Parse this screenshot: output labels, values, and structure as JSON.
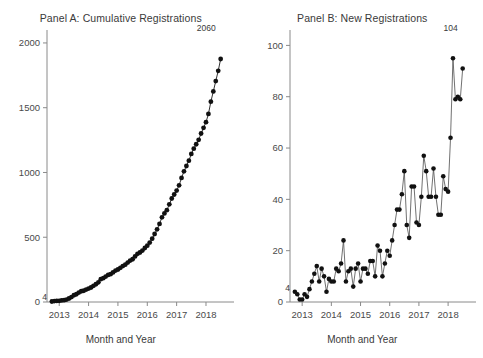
{
  "figure": {
    "width": 483,
    "height": 358,
    "background": "#ffffff",
    "ink_color": "#111111",
    "axis_color": "#8a8a8a"
  },
  "panels": [
    {
      "key": "panel_a",
      "title": "Panel A: Cumulative Registrations",
      "xlabel": "Month and Year",
      "first_point_label": "4",
      "last_point_label": "2060"
    },
    {
      "key": "panel_b",
      "title": "Panel B: New Registrations",
      "xlabel": "Month and Year",
      "first_point_label": "4",
      "last_point_label": "104"
    }
  ],
  "chart_data": [
    {
      "type": "line",
      "panel": "A",
      "title": "Panel A: Cumulative Registrations",
      "xlabel": "Month and Year",
      "ylabel": "",
      "x": [
        "2012-10",
        "2012-11",
        "2012-12",
        "2013-01",
        "2013-02",
        "2013-03",
        "2013-04",
        "2013-05",
        "2013-06",
        "2013-07",
        "2013-08",
        "2013-09",
        "2013-10",
        "2013-11",
        "2013-12",
        "2014-01",
        "2014-02",
        "2014-03",
        "2014-04",
        "2014-05",
        "2014-06",
        "2014-07",
        "2014-08",
        "2014-09",
        "2014-10",
        "2014-11",
        "2014-12",
        "2015-01",
        "2015-02",
        "2015-03",
        "2015-04",
        "2015-05",
        "2015-06",
        "2015-07",
        "2015-08",
        "2015-09",
        "2015-10",
        "2015-11",
        "2015-12",
        "2016-01",
        "2016-02",
        "2016-03",
        "2016-04",
        "2016-05",
        "2016-06",
        "2016-07",
        "2016-08",
        "2016-09",
        "2016-10",
        "2016-11",
        "2016-12",
        "2017-01",
        "2017-02",
        "2017-03",
        "2017-04",
        "2017-05",
        "2017-06",
        "2017-07",
        "2017-08",
        "2017-09",
        "2017-10",
        "2017-11",
        "2017-12",
        "2018-01",
        "2018-02",
        "2018-03",
        "2018-04",
        "2018-05",
        "2018-06",
        "2018-07"
      ],
      "values": [
        4,
        7,
        8,
        9,
        12,
        14,
        19,
        27,
        38,
        52,
        60,
        73,
        83,
        87,
        96,
        104,
        112,
        125,
        137,
        152,
        176,
        184,
        196,
        209,
        215,
        228,
        243,
        251,
        264,
        277,
        288,
        304,
        320,
        330,
        352,
        372,
        382,
        397,
        417,
        435,
        459,
        489,
        525,
        561,
        603,
        654,
        684,
        709,
        754,
        799,
        830,
        860,
        901,
        958,
        1009,
        1050,
        1091,
        1143,
        1184,
        1218,
        1252,
        1301,
        1345,
        1388,
        1452,
        1547,
        1626,
        1706,
        1785,
        1876,
        1956,
        2060
      ],
      "xlim": [
        "2012-08",
        "2018-10"
      ],
      "ylim": [
        0,
        2100
      ],
      "yticks": [
        0,
        500,
        1000,
        1500,
        2000
      ],
      "xticks": [
        "2013",
        "2014",
        "2015",
        "2016",
        "2017",
        "2018"
      ],
      "grid": false,
      "legend": "none",
      "annotations": [
        {
          "text": "4",
          "at": "2012-10",
          "value": 4
        },
        {
          "text": "2060",
          "at": "2018-07",
          "value": 2060
        }
      ]
    },
    {
      "type": "line",
      "panel": "B",
      "title": "Panel B: New Registrations",
      "xlabel": "Month and Year",
      "ylabel": "",
      "x": [
        "2012-10",
        "2012-11",
        "2012-12",
        "2013-01",
        "2013-02",
        "2013-03",
        "2013-04",
        "2013-05",
        "2013-06",
        "2013-07",
        "2013-08",
        "2013-09",
        "2013-10",
        "2013-11",
        "2013-12",
        "2014-01",
        "2014-02",
        "2014-03",
        "2014-04",
        "2014-05",
        "2014-06",
        "2014-07",
        "2014-08",
        "2014-09",
        "2014-10",
        "2014-11",
        "2014-12",
        "2015-01",
        "2015-02",
        "2015-03",
        "2015-04",
        "2015-05",
        "2015-06",
        "2015-07",
        "2015-08",
        "2015-09",
        "2015-10",
        "2015-11",
        "2015-12",
        "2016-01",
        "2016-02",
        "2016-03",
        "2016-04",
        "2016-05",
        "2016-06",
        "2016-07",
        "2016-08",
        "2016-09",
        "2016-10",
        "2016-11",
        "2016-12",
        "2017-01",
        "2017-02",
        "2017-03",
        "2017-04",
        "2017-05",
        "2017-06",
        "2017-07",
        "2017-08",
        "2017-09",
        "2017-10",
        "2017-11",
        "2017-12",
        "2018-01",
        "2018-02",
        "2018-03",
        "2018-04",
        "2018-05",
        "2018-06",
        "2018-07"
      ],
      "values": [
        4,
        3,
        1,
        1,
        3,
        2,
        5,
        8,
        11,
        14,
        8,
        13,
        10,
        4,
        9,
        8,
        8,
        13,
        12,
        15,
        24,
        8,
        12,
        13,
        6,
        13,
        15,
        8,
        13,
        13,
        11,
        16,
        16,
        10,
        22,
        20,
        10,
        15,
        20,
        18,
        24,
        30,
        36,
        36,
        42,
        51,
        30,
        25,
        45,
        45,
        31,
        30,
        41,
        57,
        51,
        41,
        41,
        52,
        41,
        34,
        34,
        49,
        44,
        43,
        64,
        95,
        79,
        80,
        79,
        91,
        80,
        104
      ],
      "xlim": [
        "2012-08",
        "2018-10"
      ],
      "ylim": [
        0,
        106
      ],
      "yticks": [
        0,
        20,
        40,
        60,
        80,
        100
      ],
      "xticks": [
        "2013",
        "2014",
        "2015",
        "2016",
        "2017",
        "2018"
      ],
      "grid": false,
      "legend": "none",
      "annotations": [
        {
          "text": "4",
          "at": "2012-10",
          "value": 4
        },
        {
          "text": "104",
          "at": "2018-07",
          "value": 104
        }
      ]
    }
  ]
}
